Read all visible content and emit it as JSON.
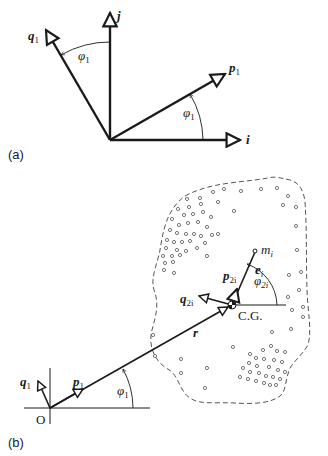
{
  "panel_a": {
    "label": "(a)",
    "axes": {
      "i": {
        "name": "i"
      },
      "j": {
        "name": "j"
      },
      "p": {
        "name": "p",
        "sub": "1"
      },
      "q": {
        "name": "q",
        "sub": "1"
      }
    },
    "angles": [
      {
        "symbol": "φ",
        "sub": "1",
        "between": "j and q1"
      },
      {
        "symbol": "φ",
        "sub": "1",
        "between": "i and p1"
      }
    ]
  },
  "panel_b": {
    "label": "(b)",
    "origin_label": "O",
    "cg_label": "C.G.",
    "vectors": {
      "q1": {
        "name": "q",
        "sub": "1"
      },
      "p1": {
        "name": "p",
        "sub": "1"
      },
      "r": {
        "name": "r"
      },
      "q2i": {
        "name": "q",
        "sub": "2i"
      },
      "p2i": {
        "name": "p",
        "sub": "2i"
      },
      "ei": {
        "name": "e",
        "sub": "i"
      }
    },
    "mass_label": {
      "name": "m",
      "sub": "i"
    },
    "angles": [
      {
        "symbol": "φ",
        "sub": "1"
      },
      {
        "symbol": "φ",
        "sub": "2i"
      }
    ]
  },
  "colors": {
    "line": "#1a1a1a",
    "dashed_outline": "#555555",
    "background": "#ffffff"
  }
}
